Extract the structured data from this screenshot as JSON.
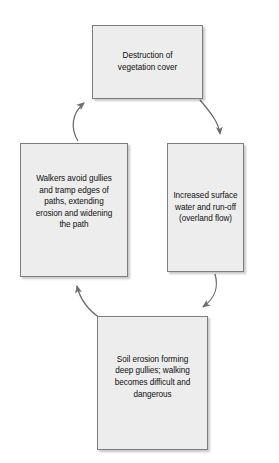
{
  "diagram": {
    "type": "cycle-flowchart",
    "style": {
      "node_fill": "#ededed",
      "node_border": "#7d7d7d",
      "arrow_color": "#6e6e6e",
      "text_color": "#0f0f0f",
      "background": "#ffffff"
    },
    "nodes": [
      {
        "id": "vegetation",
        "label": "Destruction of\nvegetation cover",
        "position": "top"
      },
      {
        "id": "runoff",
        "label": "Increased surface\nwater and run-off\n(overland flow)",
        "position": "right"
      },
      {
        "id": "gullies",
        "label": "Soil erosion forming\ndeep gullies; walking\nbecomes difficult and\ndangerous",
        "position": "bottom"
      },
      {
        "id": "walkers",
        "label": "Walkers avoid gullies\nand tramp edges of\npaths, extending\nerosion and widening\nthe path",
        "position": "left"
      }
    ],
    "edges": [
      {
        "id": "vegetation-to-runoff",
        "from": "vegetation",
        "to": "runoff",
        "direction": "clockwise"
      },
      {
        "id": "runoff-to-gullies",
        "from": "runoff",
        "to": "gullies",
        "direction": "clockwise"
      },
      {
        "id": "gullies-to-walkers",
        "from": "gullies",
        "to": "walkers",
        "direction": "clockwise"
      },
      {
        "id": "walkers-to-vegetation",
        "from": "walkers",
        "to": "vegetation",
        "direction": "clockwise"
      }
    ]
  }
}
